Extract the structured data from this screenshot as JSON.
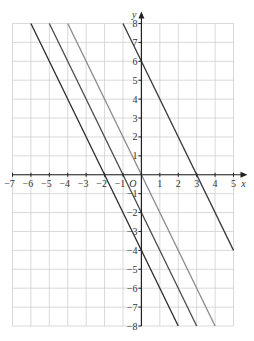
{
  "chart_data": {
    "type": "line",
    "title": "",
    "xlabel": "x",
    "ylabel": "y",
    "origin_label": "O",
    "xlim": [
      -7,
      5
    ],
    "ylim": [
      -8,
      8
    ],
    "grid": true,
    "x_ticks": [
      "-7",
      "-6",
      "-5",
      "-4",
      "-3",
      "-2",
      "-1",
      "1",
      "2",
      "3",
      "4",
      "5"
    ],
    "y_ticks": [
      "8",
      "7",
      "6",
      "5",
      "4",
      "3",
      "2",
      "1",
      "-1",
      "-2",
      "-3",
      "-4",
      "-5",
      "-6",
      "-7",
      "-8"
    ],
    "series": [
      {
        "name": "y = -2x - 4",
        "slope": -2,
        "intercept": -4,
        "points": [
          [
            -6,
            8
          ],
          [
            2,
            -8
          ]
        ],
        "color": "#2b2b2b"
      },
      {
        "name": "y = -2x - 2",
        "slope": -2,
        "intercept": -2,
        "points": [
          [
            -5,
            8
          ],
          [
            3,
            -8
          ]
        ],
        "color": "#4a4a4a"
      },
      {
        "name": "y = -2x",
        "slope": -2,
        "intercept": 0,
        "points": [
          [
            -4,
            8
          ],
          [
            4,
            -8
          ]
        ],
        "color": "#8a8a8a"
      },
      {
        "name": "y = -2x + 6",
        "slope": -2,
        "intercept": 6,
        "points": [
          [
            -1,
            8
          ],
          [
            5,
            -4
          ]
        ],
        "color": "#3a3a3a"
      }
    ],
    "legend": "none"
  },
  "colors": {
    "grid": "#cfcfcf",
    "axis": "#222222"
  }
}
